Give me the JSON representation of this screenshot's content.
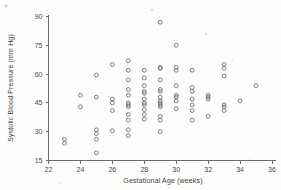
{
  "chart_data": {
    "type": "scatter",
    "title": "",
    "xlabel": "Gestational Age (weeks)",
    "ylabel": "Systolic Blood Pressure (mm Hg)",
    "xlim": [
      22,
      36
    ],
    "ylim": [
      15,
      90
    ],
    "xticks": [
      22,
      24,
      26,
      28,
      30,
      32,
      34,
      36
    ],
    "yticks": [
      15,
      30,
      45,
      60,
      75,
      90
    ],
    "xtick_labels": [
      "22",
      "24",
      "26",
      "28",
      "30",
      "32",
      "34",
      "36"
    ],
    "ytick_labels": [
      "15",
      "30",
      "45",
      "60",
      "75",
      "90"
    ],
    "grid": false,
    "legend": null,
    "marker": "open-circle",
    "marker_color": "#717171",
    "points": [
      {
        "x": 23,
        "y": 26
      },
      {
        "x": 23,
        "y": 24
      },
      {
        "x": 24,
        "y": 49
      },
      {
        "x": 24,
        "y": 43
      },
      {
        "x": 25,
        "y": 59.5
      },
      {
        "x": 25,
        "y": 48
      },
      {
        "x": 25,
        "y": 31
      },
      {
        "x": 25,
        "y": 29
      },
      {
        "x": 25,
        "y": 26
      },
      {
        "x": 25,
        "y": 19
      },
      {
        "x": 26,
        "y": 65
      },
      {
        "x": 26,
        "y": 47
      },
      {
        "x": 26,
        "y": 45
      },
      {
        "x": 26,
        "y": 41
      },
      {
        "x": 26,
        "y": 30.5
      },
      {
        "x": 27,
        "y": 67
      },
      {
        "x": 27,
        "y": 62
      },
      {
        "x": 27,
        "y": 57
      },
      {
        "x": 27,
        "y": 52
      },
      {
        "x": 27,
        "y": 49
      },
      {
        "x": 27,
        "y": 45
      },
      {
        "x": 27,
        "y": 44
      },
      {
        "x": 27,
        "y": 43
      },
      {
        "x": 27,
        "y": 39
      },
      {
        "x": 27,
        "y": 36
      },
      {
        "x": 27,
        "y": 31
      },
      {
        "x": 27,
        "y": 28
      },
      {
        "x": 28,
        "y": 62
      },
      {
        "x": 28,
        "y": 58
      },
      {
        "x": 28,
        "y": 54
      },
      {
        "x": 28,
        "y": 51
      },
      {
        "x": 28,
        "y": 50
      },
      {
        "x": 28,
        "y": 47
      },
      {
        "x": 28,
        "y": 45
      },
      {
        "x": 28,
        "y": 44
      },
      {
        "x": 28,
        "y": 41.5
      },
      {
        "x": 28,
        "y": 39
      },
      {
        "x": 28,
        "y": 36.5
      },
      {
        "x": 29,
        "y": 87
      },
      {
        "x": 29,
        "y": 63.5
      },
      {
        "x": 29,
        "y": 63
      },
      {
        "x": 29,
        "y": 57
      },
      {
        "x": 29,
        "y": 52
      },
      {
        "x": 29,
        "y": 51
      },
      {
        "x": 29,
        "y": 48
      },
      {
        "x": 29,
        "y": 46
      },
      {
        "x": 29,
        "y": 45
      },
      {
        "x": 29,
        "y": 44
      },
      {
        "x": 29,
        "y": 43
      },
      {
        "x": 29,
        "y": 38
      },
      {
        "x": 29,
        "y": 36
      },
      {
        "x": 29,
        "y": 30
      },
      {
        "x": 30,
        "y": 75
      },
      {
        "x": 30,
        "y": 63.5
      },
      {
        "x": 30,
        "y": 62
      },
      {
        "x": 30,
        "y": 54
      },
      {
        "x": 30,
        "y": 49
      },
      {
        "x": 30,
        "y": 48
      },
      {
        "x": 30,
        "y": 46
      },
      {
        "x": 30,
        "y": 42
      },
      {
        "x": 31,
        "y": 62
      },
      {
        "x": 31,
        "y": 53
      },
      {
        "x": 31,
        "y": 51
      },
      {
        "x": 31,
        "y": 47
      },
      {
        "x": 31,
        "y": 44
      },
      {
        "x": 31,
        "y": 41
      },
      {
        "x": 31,
        "y": 36
      },
      {
        "x": 32,
        "y": 49
      },
      {
        "x": 32,
        "y": 48
      },
      {
        "x": 32,
        "y": 47
      },
      {
        "x": 32,
        "y": 38
      },
      {
        "x": 33,
        "y": 65
      },
      {
        "x": 33,
        "y": 63
      },
      {
        "x": 33,
        "y": 59
      },
      {
        "x": 33,
        "y": 44
      },
      {
        "x": 33,
        "y": 43
      },
      {
        "x": 33,
        "y": 41
      },
      {
        "x": 34,
        "y": 46
      },
      {
        "x": 35,
        "y": 54
      }
    ]
  },
  "axes": {
    "x_title": "Gestational Age (weeks)",
    "y_title": "Systolic Blood Pressure (mm Hg)"
  }
}
